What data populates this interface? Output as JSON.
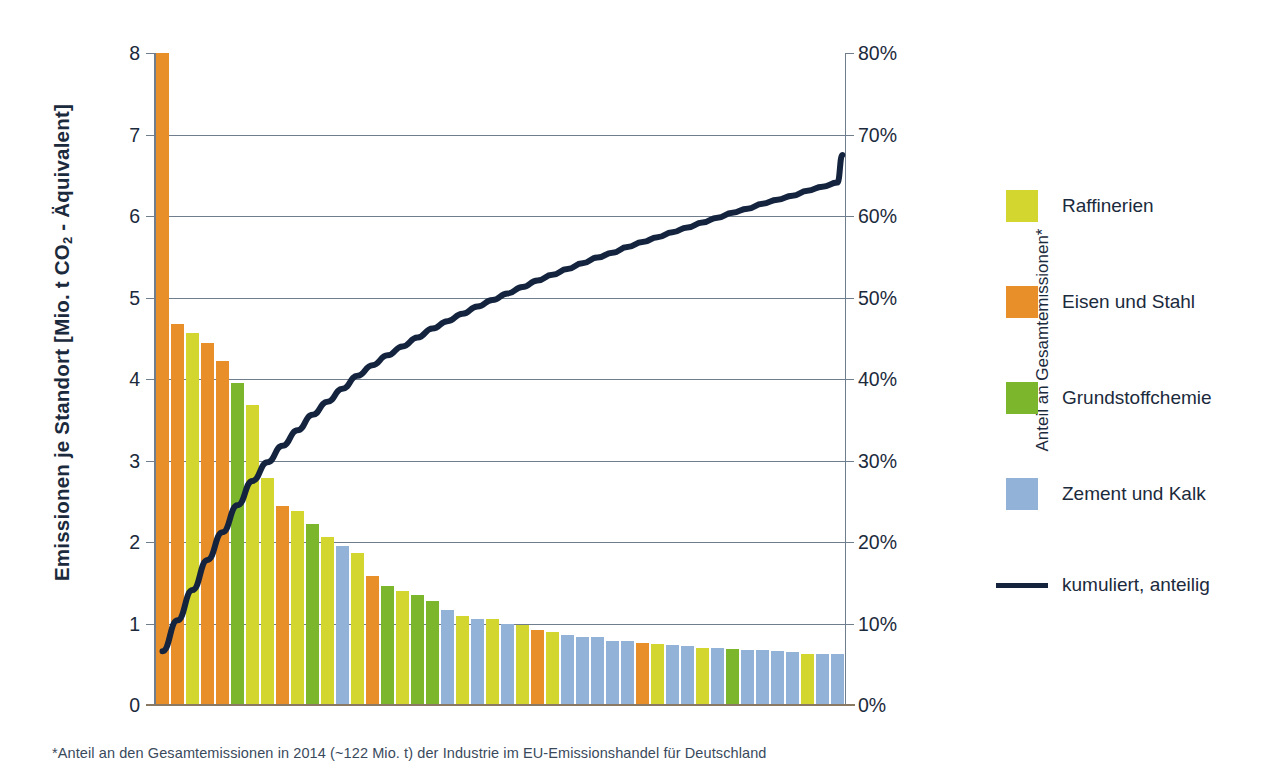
{
  "chart_data": {
    "type": "bar",
    "title": "",
    "subtitle": "",
    "xlabel": "",
    "ylabel": "Emissionen je Standort [Mio. t CO2 - Äquivalent]",
    "ylabel_right": "Anteil an Gesamtemissionen*",
    "ylim": [
      0,
      8
    ],
    "ylim_right": [
      0,
      80
    ],
    "grid": true,
    "legend_position": "right",
    "yticks": [
      "0",
      "1",
      "2",
      "3",
      "4",
      "5",
      "6",
      "7",
      "8"
    ],
    "yticks_right": [
      "0%",
      "10%",
      "20%",
      "30%",
      "40%",
      "50%",
      "60%",
      "70%",
      "80%"
    ],
    "footnote": "*Anteil an den Gesamtemissionen in 2014 (~122 Mio. t) der Industrie im EU-Emissionshandel für Deutschland",
    "categories": [
      "1",
      "2",
      "3",
      "4",
      "5",
      "6",
      "7",
      "8",
      "9",
      "10",
      "11",
      "12",
      "13",
      "14",
      "15",
      "16",
      "17",
      "18",
      "19",
      "20",
      "21",
      "22",
      "23",
      "24",
      "25",
      "26",
      "27",
      "28",
      "29",
      "30",
      "31",
      "32",
      "33",
      "34",
      "35",
      "36",
      "37",
      "38",
      "39",
      "40",
      "41",
      "42",
      "43",
      "44",
      "45",
      "46"
    ],
    "values": [
      8.0,
      4.67,
      4.56,
      4.44,
      4.22,
      3.95,
      3.68,
      2.78,
      2.44,
      2.38,
      2.22,
      2.06,
      1.95,
      1.87,
      1.58,
      1.46,
      1.4,
      1.35,
      1.28,
      1.17,
      1.09,
      1.06,
      1.05,
      0.99,
      0.98,
      0.92,
      0.89,
      0.86,
      0.84,
      0.83,
      0.78,
      0.78,
      0.76,
      0.75,
      0.74,
      0.73,
      0.7,
      0.7,
      0.69,
      0.68,
      0.67,
      0.66,
      0.65,
      0.63,
      0.62,
      0.62
    ],
    "bar_sectors": [
      "Eisen und Stahl",
      "Eisen und Stahl",
      "Raffinerien",
      "Eisen und Stahl",
      "Eisen und Stahl",
      "Grundstoffchemie",
      "Raffinerien",
      "Raffinerien",
      "Eisen und Stahl",
      "Raffinerien",
      "Grundstoffchemie",
      "Raffinerien",
      "Zement und Kalk",
      "Raffinerien",
      "Eisen und Stahl",
      "Grundstoffchemie",
      "Raffinerien",
      "Grundstoffchemie",
      "Grundstoffchemie",
      "Zement und Kalk",
      "Raffinerien",
      "Zement und Kalk",
      "Raffinerien",
      "Zement und Kalk",
      "Raffinerien",
      "Eisen und Stahl",
      "Raffinerien",
      "Zement und Kalk",
      "Zement und Kalk",
      "Zement und Kalk",
      "Zement und Kalk",
      "Zement und Kalk",
      "Eisen und Stahl",
      "Raffinerien",
      "Zement und Kalk",
      "Zement und Kalk",
      "Raffinerien",
      "Zement und Kalk",
      "Grundstoffchemie",
      "Zement und Kalk",
      "Zement und Kalk",
      "Zement und Kalk",
      "Zement und Kalk",
      "Raffinerien",
      "Zement und Kalk",
      "Zement und Kalk"
    ],
    "series": [
      {
        "name": "kumuliert, anteilig",
        "type": "line",
        "axis": "right",
        "unit": "%",
        "values": [
          6.6,
          10.4,
          14.1,
          17.8,
          21.2,
          24.5,
          27.5,
          29.8,
          31.8,
          33.7,
          35.6,
          37.2,
          38.8,
          40.4,
          41.7,
          42.9,
          44.0,
          45.1,
          46.2,
          47.1,
          48.0,
          48.9,
          49.7,
          50.5,
          51.3,
          52.1,
          52.8,
          53.5,
          54.2,
          54.9,
          55.5,
          56.2,
          56.8,
          57.4,
          58.0,
          58.6,
          59.2,
          59.8,
          60.4,
          60.9,
          61.5,
          62.0,
          62.5,
          63.1,
          63.6,
          64.1
        ],
        "end_value": 67.5
      }
    ],
    "colors": {
      "Raffinerien": "#d2d62e",
      "Eisen und Stahl": "#e88f2a",
      "Grundstoffchemie": "#7cb62c",
      "Zement und Kalk": "#93b2d8",
      "kumuliert_line": "#14243f",
      "grid": "#6f7d8c",
      "baseline": "#8a7a63",
      "text": "#1b2a3c"
    }
  },
  "legend": {
    "items": [
      {
        "label": "Raffinerien",
        "color": "#d2d62e",
        "kind": "swatch"
      },
      {
        "label": "Eisen und Stahl",
        "color": "#e88f2a",
        "kind": "swatch"
      },
      {
        "label": "Grundstoffchemie",
        "color": "#7cb62c",
        "kind": "swatch"
      },
      {
        "label": "Zement und Kalk",
        "color": "#93b2d8",
        "kind": "swatch"
      },
      {
        "label": "kumuliert, anteilig",
        "color": "#14243f",
        "kind": "line"
      }
    ]
  },
  "axes": {
    "left_title_pre": "Emissionen je Standort [Mio. t CO",
    "left_title_sub": "2",
    "left_title_post": " - Äquivalent]",
    "right_title": "Anteil an Gesamtemissionen*"
  },
  "footnote": {
    "text": "*Anteil an den Gesamtemissionen in 2014 (~122 Mio. t) der Industrie im EU-Emissionshandel für Deutschland"
  }
}
